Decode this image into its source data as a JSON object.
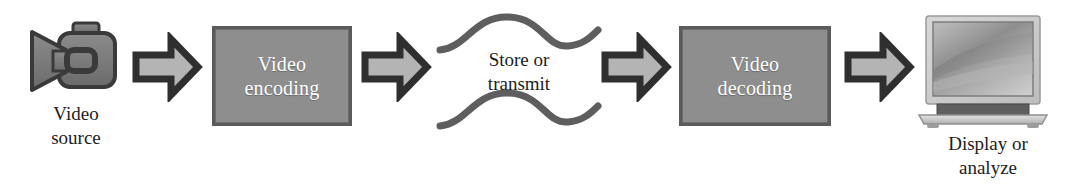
{
  "diagram": {
    "type": "flowchart",
    "orientation": "left-to-right",
    "background_color": "#ffffff",
    "palette": {
      "box_fill": "#8e8e8e",
      "box_border": "#5b5b5b",
      "box_text": "#ffffff",
      "arrow_fill": "#b4b4b4",
      "arrow_border": "#333333",
      "icon_gray": "#6e6e6e",
      "wave_stroke": "#5e5e5e",
      "caption_text": "#1d1d1d"
    },
    "nodes": [
      {
        "id": "video-source",
        "kind": "icon",
        "icon": "camcorder-icon",
        "label": "Video\nsource",
        "label_position": "below"
      },
      {
        "id": "video-encoding",
        "kind": "process-box",
        "label": "Video\nencoding",
        "fill": "#8e8e8e",
        "text_color": "#ffffff"
      },
      {
        "id": "store-or-transmit",
        "kind": "channel",
        "icon": "wavy-lines-icon",
        "label": "Store or\ntransmit"
      },
      {
        "id": "video-decoding",
        "kind": "process-box",
        "label": "Video\ndecoding",
        "fill": "#8e8e8e",
        "text_color": "#ffffff"
      },
      {
        "id": "display-or-analyze",
        "kind": "icon",
        "icon": "laptop-icon",
        "label": "Display or\nanalyze",
        "label_position": "below"
      }
    ],
    "connectors": [
      {
        "id": "arrow-1",
        "icon": "block-arrow-right-icon",
        "from": "video-source",
        "to": "video-encoding"
      },
      {
        "id": "arrow-2",
        "icon": "block-arrow-right-icon",
        "from": "video-encoding",
        "to": "store-or-transmit"
      },
      {
        "id": "arrow-3",
        "icon": "block-arrow-right-icon",
        "from": "store-or-transmit",
        "to": "video-decoding"
      },
      {
        "id": "arrow-4",
        "icon": "block-arrow-right-icon",
        "from": "video-decoding",
        "to": "display-or-analyze"
      }
    ]
  }
}
